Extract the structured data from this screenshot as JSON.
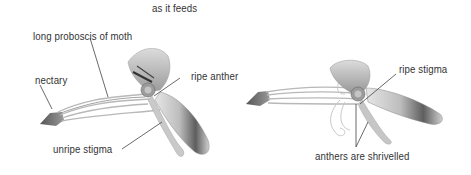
{
  "caption": {
    "top": "as it feeds"
  },
  "left_flower": {
    "labels": {
      "proboscis": "long proboscis of moth",
      "nectary": "nectary",
      "ripe_anther": "ripe anther",
      "unripe_stigma": "unripe stigma"
    }
  },
  "right_flower": {
    "labels": {
      "ripe_stigma": "ripe stigma",
      "anthers": "anthers are shrivelled"
    }
  },
  "colors": {
    "text": "#333333",
    "leader_line": "#444444",
    "nectary": "#6e6e6e",
    "tube_stroke": "#b5b5b5",
    "wing_light": "#d6d6d6",
    "wing_dark": "#6a6a6a"
  }
}
